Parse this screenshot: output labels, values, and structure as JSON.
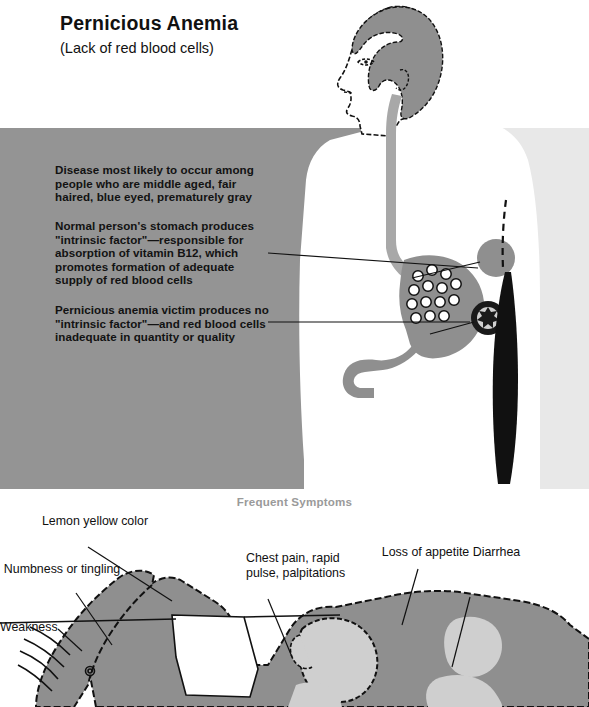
{
  "document": {
    "title": "Pernicious Anemia",
    "subtitle": "(Lack of red blood cells)"
  },
  "upper_panel": {
    "paragraphs": [
      "Disease most likely to occur among people who are middle aged, fair haired, blue eyed, prematurely gray",
      "Normal person's stomach produces \"intrinsic factor\"—responsible for absorption of vitamin B12, which promotes formation of adequate supply of red blood cells",
      "Pernicious anemia victim produces no \"intrinsic factor\"—and red blood cells inadequate in quantity or quality"
    ]
  },
  "lower_panel": {
    "heading": "Frequent Symptoms",
    "symptoms": [
      {
        "label": "Lemon yellow color"
      },
      {
        "label": "Numbness or tingling"
      },
      {
        "label": "Weakness"
      },
      {
        "label": "Chest pain, rapid pulse, palpitations"
      },
      {
        "label": "Loss of appetite Diarrhea"
      }
    ]
  },
  "colors": {
    "band_gray": "#949494",
    "light_panel": "#e8e8e8",
    "figure_gray": "#8f8f8f",
    "organ_gray": "#a8a8a8",
    "organ_light": "#cfcfcf",
    "ink": "#111111",
    "heading_gray": "#9a9a9a"
  }
}
